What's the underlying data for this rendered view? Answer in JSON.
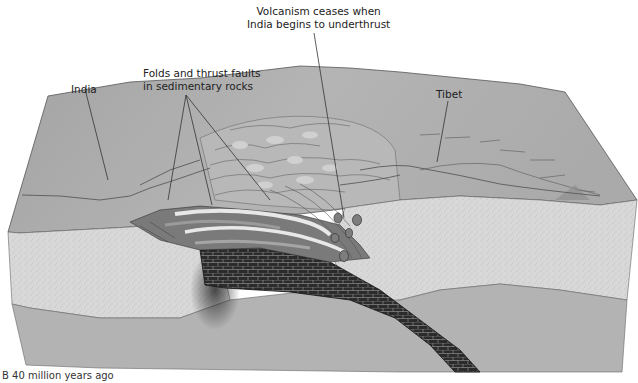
{
  "figure": {
    "caption": "B   40 million years ago",
    "labels": {
      "volcanism": [
        "Volcanism ceases when",
        "India begins to underthrust"
      ],
      "folds": [
        "Folds and thrust faults",
        "in sedimentary rocks"
      ],
      "india": "India",
      "tibet": "Tibet"
    },
    "colors": {
      "surface": "#a9a9a9",
      "crust": "#d6d6d6",
      "mantle": "#b2b2b2",
      "subducting_slab": "#2a2a2a",
      "sediment_light": "#e6e6e6",
      "sediment_dark": "#6e6e6e",
      "leader_line": "#333333"
    }
  }
}
